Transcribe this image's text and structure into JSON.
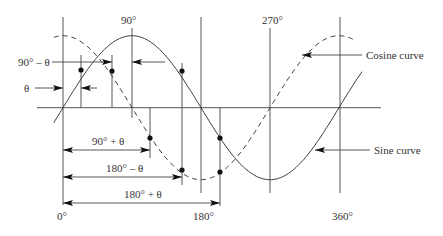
{
  "diagram": {
    "axis_labels": {
      "deg0": "0°",
      "deg90": "90°",
      "deg180": "180°",
      "deg270": "270°",
      "deg360": "360°"
    },
    "angle_labels": {
      "theta": "θ",
      "ninety_minus_theta": "90° – θ",
      "ninety_plus_theta": "90° + θ",
      "one_eighty_minus_theta": "180° – θ",
      "one_eighty_plus_theta": "180° + θ"
    },
    "curve_labels": {
      "cosine": "Cosine curve",
      "sine": "Sine curve"
    },
    "geometry": {
      "x_origin": 63,
      "px_per_90deg": 69,
      "axis_y": 107.7,
      "amplitude": 72,
      "theta_deg": 24
    },
    "colors": {
      "line": "#444444",
      "text": "#333333",
      "dot": "#111111"
    }
  }
}
